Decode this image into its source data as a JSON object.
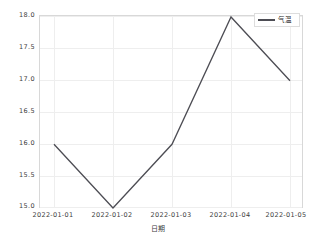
{
  "chart_data": {
    "type": "line",
    "title": "",
    "xlabel": "日期",
    "ylabel": "",
    "categories": [
      "2022-01-01",
      "2022-01-02",
      "2022-01-03",
      "2022-01-04",
      "2022-01-05"
    ],
    "series": [
      {
        "name": "气温",
        "values": [
          16.0,
          15.0,
          16.0,
          18.0,
          17.0
        ],
        "color": "#4d4d54"
      }
    ],
    "ylim": [
      15.0,
      18.0
    ],
    "yticks": [
      "15.0",
      "15.5",
      "16.0",
      "16.5",
      "17.0",
      "17.5",
      "18.0"
    ],
    "ytick_values": [
      15.0,
      15.5,
      16.0,
      16.5,
      17.0,
      17.5,
      18.0
    ],
    "xticks": [
      "2022-01-01",
      "2022-01-02",
      "2022-01-03",
      "2022-01-04",
      "2022-01-05"
    ],
    "grid": true,
    "legend": {
      "position": "upper right",
      "entries": [
        "气温"
      ]
    },
    "background_color": "#ffffff",
    "grid_color": "#eeeeee",
    "axis_color": "#d8d8d8"
  },
  "axis": {
    "y_ticks": [
      {
        "label": "18.0"
      },
      {
        "label": "17.5"
      },
      {
        "label": "17.0"
      },
      {
        "label": "16.5"
      },
      {
        "label": "16.0"
      },
      {
        "label": "15.5"
      },
      {
        "label": "15.0"
      }
    ],
    "x_ticks": [
      {
        "label": "2022-01-01"
      },
      {
        "label": "2022-01-02"
      },
      {
        "label": "2022-01-03"
      },
      {
        "label": "2022-01-04"
      },
      {
        "label": "2022-01-05"
      }
    ],
    "x_axis_label": "日期"
  },
  "legend": {
    "label": "气温"
  }
}
